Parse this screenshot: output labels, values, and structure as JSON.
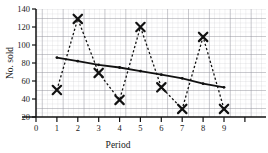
{
  "chart_data": {
    "type": "line",
    "title": "",
    "xlabel": "Period",
    "ylabel": "No. sold",
    "x": [
      1,
      2,
      3,
      4,
      5,
      6,
      7,
      8,
      9
    ],
    "xlim": [
      0,
      9
    ],
    "ylim": [
      20,
      140
    ],
    "xticks": [
      "0",
      "1",
      "2",
      "3",
      "4",
      "5",
      "6",
      "7",
      "8",
      "9"
    ],
    "yticks": [
      "20",
      "40",
      "60",
      "80",
      "100",
      "120",
      "140"
    ],
    "grid": "graph-paper minor and major gridlines",
    "legend": "none",
    "series": [
      {
        "name": "No. sold",
        "marker": "x-cross",
        "linestyle": "dotted",
        "values": [
          50,
          129,
          69,
          39,
          120,
          53,
          29,
          109,
          29
        ]
      },
      {
        "name": "Trend line",
        "marker": "small-dot",
        "linestyle": "solid",
        "values": [
          86,
          82,
          78,
          75,
          71,
          67,
          63,
          57,
          53
        ]
      }
    ]
  },
  "colors": {
    "ink": "#111111",
    "grid_minor": "#c9c9cf",
    "grid_major": "#8e8e98",
    "background": "#ffffff"
  }
}
